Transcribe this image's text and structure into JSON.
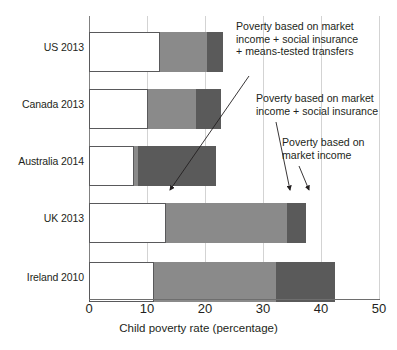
{
  "chart_data": {
    "type": "bar",
    "orientation": "horizontal",
    "stacked": true,
    "title": "",
    "xlabel": "Child poverty rate (percentage)",
    "ylabel": "",
    "xlim": [
      0,
      50
    ],
    "xticks": [
      0,
      10,
      20,
      30,
      40,
      50
    ],
    "xtick_labels": [
      "0",
      "10",
      "20",
      "30",
      "40",
      "50"
    ],
    "grid": "vertical",
    "legend_position": "annotations",
    "categories": [
      "US 2013",
      "Canada 2013",
      "Australia 2014",
      "UK 2013",
      "Ireland 2010"
    ],
    "series": [
      {
        "name": "Poverty based on market income + social insurance + means-tested transfers",
        "color": "#ffffff",
        "values": [
          12.3,
          10.1,
          7.7,
          13.3,
          11.2
        ]
      },
      {
        "name": "Poverty based on market income + social insurance",
        "color": "#8a8a8a",
        "values": [
          20.3,
          18.5,
          8.5,
          34.2,
          32.3
        ]
      },
      {
        "name": "Poverty based on market income",
        "color": "#5a5a5a",
        "values": [
          23.1,
          22.7,
          21.9,
          37.4,
          42.4
        ]
      }
    ],
    "annotations": [
      {
        "id": "market-social-means",
        "text": "Poverty based on market\nincome + social insurance\n+ means-tested transfers",
        "points_to": "UK 2013 white segment edge"
      },
      {
        "id": "market-social",
        "text": "Poverty based on market\nincome + social insurance",
        "points_to": "UK 2013 mid-grey segment edge"
      },
      {
        "id": "market",
        "text": "Poverty based on\nmarket income",
        "points_to": "UK 2013 dark-grey segment edge"
      }
    ],
    "colors": {
      "segment_means_tested": "#ffffff",
      "segment_social_insurance": "#8a8a8a",
      "segment_market_income": "#5a5a5a",
      "axis": "#6e6e6e",
      "gridline": "#d3d3d3",
      "text": "#231f20"
    }
  }
}
